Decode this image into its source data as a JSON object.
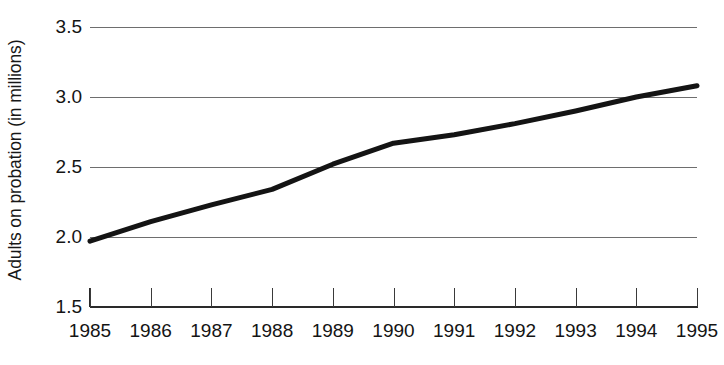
{
  "chart_data": {
    "type": "line",
    "title": "",
    "subtitle": "",
    "xlabel": "",
    "ylabel": "Adults on probation (in millions)",
    "x": [
      1985,
      1986,
      1987,
      1988,
      1989,
      1990,
      1991,
      1992,
      1993,
      1994,
      1995
    ],
    "categories": [
      "1985",
      "1986",
      "1987",
      "1988",
      "1989",
      "1990",
      "1991",
      "1992",
      "1993",
      "1994",
      "1995"
    ],
    "values": [
      1.97,
      2.11,
      2.23,
      2.34,
      2.52,
      2.67,
      2.73,
      2.81,
      2.9,
      3.0,
      3.08
    ],
    "series": [
      {
        "name": "Adults on probation",
        "values": [
          1.97,
          2.11,
          2.23,
          2.34,
          2.52,
          2.67,
          2.73,
          2.81,
          2.9,
          3.0,
          3.08
        ]
      }
    ],
    "xlim": [
      1985,
      1995
    ],
    "ylim": [
      1.5,
      3.5
    ],
    "ytick_labels": [
      "3.5",
      "3.0",
      "2.5",
      "2.0",
      "1.5"
    ],
    "ytick_values": [
      3.5,
      3.0,
      2.5,
      2.0,
      1.5
    ],
    "xtick_labels": [
      "1985",
      "1986",
      "1987",
      "1988",
      "1989",
      "1990",
      "1991",
      "1992",
      "1993",
      "1994",
      "1995"
    ],
    "gridlines": {
      "horizontal": [
        3.5,
        3.0,
        2.5,
        2.0
      ],
      "vertical": false,
      "color": "#6e6e6e"
    },
    "legend": {
      "visible": false,
      "position": "none"
    },
    "line_color": "#141414",
    "line_width": 5,
    "markers": false,
    "background": "#ffffff"
  }
}
